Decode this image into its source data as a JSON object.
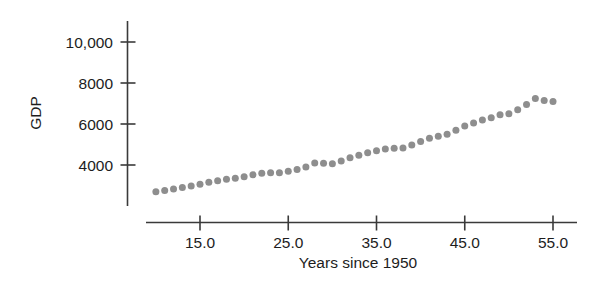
{
  "chart_data": {
    "type": "scatter",
    "title": "",
    "xlabel": "Years since 1950",
    "ylabel": "GDP",
    "xlim": [
      9.0,
      56.5
    ],
    "ylim": [
      2200,
      11200
    ],
    "grid": false,
    "legend": null,
    "xticks": [
      15.0,
      25.0,
      35.0,
      45.0,
      55.0
    ],
    "xtick_labels": [
      "15.0",
      "25.0",
      "35.0",
      "45.0",
      "55.0"
    ],
    "yticks": [
      4000,
      6000,
      8000,
      10000
    ],
    "ytick_labels": [
      "4000",
      "6000",
      "8000",
      "10,000"
    ],
    "marker": "filled-circle",
    "marker_color": "#8e8e8e",
    "marker_size_px": 7,
    "series": [
      {
        "name": "GDP",
        "x": [
          10,
          11,
          12,
          13,
          14,
          15,
          16,
          17,
          18,
          19,
          20,
          21,
          22,
          23,
          24,
          25,
          26,
          27,
          28,
          29,
          30,
          31,
          32,
          33,
          34,
          35,
          36,
          37,
          38,
          39,
          40,
          41,
          42,
          43,
          44,
          45,
          46,
          47,
          48,
          49,
          50,
          51,
          52,
          53,
          54,
          55
        ],
        "y": [
          2700,
          2760,
          2830,
          2900,
          2970,
          3060,
          3160,
          3230,
          3300,
          3350,
          3430,
          3520,
          3600,
          3620,
          3620,
          3700,
          3780,
          3900,
          4100,
          4080,
          4060,
          4200,
          4350,
          4480,
          4600,
          4700,
          4780,
          4820,
          4830,
          4980,
          5150,
          5300,
          5400,
          5500,
          5700,
          5900,
          6050,
          6200,
          6300,
          6450,
          6500,
          6700,
          6950,
          7250,
          7150,
          7100
        ]
      }
    ],
    "_series_note": "values estimated from axis gridline positions"
  },
  "axis": {
    "y_label": "GDP",
    "x_label": "Years since 1950"
  }
}
